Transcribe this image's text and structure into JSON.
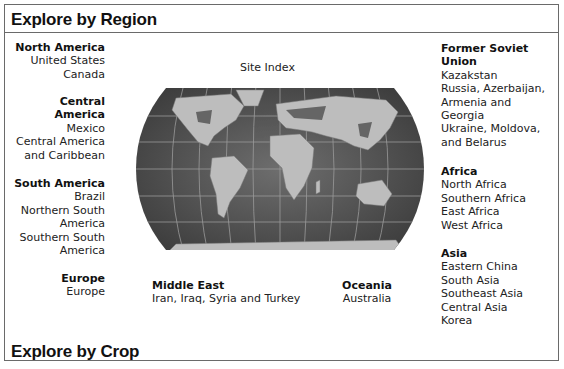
{
  "sections": {
    "region_title": "Explore by Region",
    "crop_title": "Explore by Crop"
  },
  "map": {
    "label": "Site Index",
    "alt": "World map"
  },
  "regions": {
    "north_america": {
      "title": "North America",
      "items": [
        "United States",
        "Canada"
      ]
    },
    "central_america": {
      "title_line1": "Central",
      "title_line2": "America",
      "items": [
        "Mexico",
        "Central America",
        "and Caribbean"
      ]
    },
    "south_america": {
      "title": "South America",
      "items": [
        "Brazil",
        "Northern South",
        "America",
        "Southern South",
        "America"
      ]
    },
    "europe": {
      "title": "Europe",
      "items": [
        "Europe"
      ]
    },
    "middle_east": {
      "title": "Middle East",
      "items": [
        "Iran, Iraq, Syria and Turkey"
      ]
    },
    "oceania": {
      "title": "Oceania",
      "items": [
        "Australia"
      ]
    },
    "former_soviet_union": {
      "title_line1": "Former Soviet",
      "title_line2": "Union",
      "items": [
        "Kazakstan",
        "Russia, Azerbaijan,",
        "Armenia and",
        "Georgia",
        "Ukraine, Moldova,",
        "and Belarus"
      ]
    },
    "africa": {
      "title": "Africa",
      "items": [
        "North Africa",
        "Southern Africa",
        "East Africa",
        "West Africa"
      ]
    },
    "asia": {
      "title": "Asia",
      "items": [
        "Eastern China",
        "South Asia",
        "Southeast Asia",
        "Central Asia",
        "Korea"
      ]
    }
  }
}
